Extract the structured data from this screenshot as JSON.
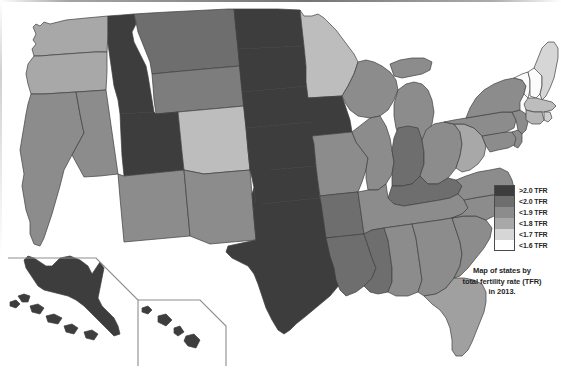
{
  "legend": {
    "title": "TFR legend",
    "entries": [
      {
        "label": ">2.0 TFR",
        "color": "#3d3d3d"
      },
      {
        "label": "<2.0 TFR",
        "color": "#6e6e6e"
      },
      {
        "label": "<1.9 TFR",
        "color": "#8c8c8c"
      },
      {
        "label": "<1.8 TFR",
        "color": "#a8a8a8"
      },
      {
        "label": "<1.7 TFR",
        "color": "#d6d6d6"
      },
      {
        "label": "<1.6 TFR",
        "color": "#ffffff"
      }
    ]
  },
  "caption": {
    "line1": "Map of states by",
    "line2": "total fertility rate (TFR)",
    "line3": "in 2013."
  },
  "map": {
    "title": "Map of states by total fertility rate (TFR) in 2013.",
    "stroke": "#3f3f3f",
    "states": [
      {
        "code": "WA",
        "name": "Washington",
        "bin": "<1.8 TFR",
        "color": "#a8a8a8"
      },
      {
        "code": "OR",
        "name": "Oregon",
        "bin": "<1.8 TFR",
        "color": "#a8a8a8"
      },
      {
        "code": "CA",
        "name": "California",
        "bin": "<1.9 TFR",
        "color": "#8c8c8c"
      },
      {
        "code": "NV",
        "name": "Nevada",
        "bin": "<1.9 TFR",
        "color": "#8c8c8c"
      },
      {
        "code": "ID",
        "name": "Idaho",
        "bin": ">2.0 TFR",
        "color": "#3d3d3d"
      },
      {
        "code": "MT",
        "name": "Montana",
        "bin": "<2.0 TFR",
        "color": "#6e6e6e"
      },
      {
        "code": "WY",
        "name": "Wyoming",
        "bin": "<2.0 TFR",
        "color": "#7d7d7d"
      },
      {
        "code": "UT",
        "name": "Utah",
        "bin": ">2.0 TFR",
        "color": "#3d3d3d"
      },
      {
        "code": "AZ",
        "name": "Arizona",
        "bin": "<1.9 TFR",
        "color": "#8c8c8c"
      },
      {
        "code": "CO",
        "name": "Colorado",
        "bin": "<1.8 TFR",
        "color": "#bdbdbd"
      },
      {
        "code": "NM",
        "name": "New Mexico",
        "bin": "<1.9 TFR",
        "color": "#8c8c8c"
      },
      {
        "code": "ND",
        "name": "North Dakota",
        "bin": ">2.0 TFR",
        "color": "#3d3d3d"
      },
      {
        "code": "SD",
        "name": "South Dakota",
        "bin": ">2.0 TFR",
        "color": "#3d3d3d"
      },
      {
        "code": "NE",
        "name": "Nebraska",
        "bin": ">2.0 TFR",
        "color": "#3d3d3d"
      },
      {
        "code": "KS",
        "name": "Kansas",
        "bin": ">2.0 TFR",
        "color": "#3d3d3d"
      },
      {
        "code": "OK",
        "name": "Oklahoma",
        "bin": ">2.0 TFR",
        "color": "#3d3d3d"
      },
      {
        "code": "TX",
        "name": "Texas",
        "bin": ">2.0 TFR",
        "color": "#3d3d3d"
      },
      {
        "code": "MN",
        "name": "Minnesota",
        "bin": "<1.8 TFR",
        "color": "#bdbdbd"
      },
      {
        "code": "IA",
        "name": "Iowa",
        "bin": ">2.0 TFR",
        "color": "#3d3d3d"
      },
      {
        "code": "MO",
        "name": "Missouri",
        "bin": "<2.0 TFR",
        "color": "#8c8c8c"
      },
      {
        "code": "AR",
        "name": "Arkansas",
        "bin": "<2.0 TFR",
        "color": "#6e6e6e"
      },
      {
        "code": "LA",
        "name": "Louisiana",
        "bin": "<2.0 TFR",
        "color": "#6e6e6e"
      },
      {
        "code": "WI",
        "name": "Wisconsin",
        "bin": "<1.9 TFR",
        "color": "#8c8c8c"
      },
      {
        "code": "IL",
        "name": "Illinois",
        "bin": "<1.9 TFR",
        "color": "#8c8c8c"
      },
      {
        "code": "MI",
        "name": "Michigan",
        "bin": "<1.9 TFR",
        "color": "#8c8c8c"
      },
      {
        "code": "IN",
        "name": "Indiana",
        "bin": "<2.0 TFR",
        "color": "#6e6e6e"
      },
      {
        "code": "OH",
        "name": "Ohio",
        "bin": "<1.9 TFR",
        "color": "#8c8c8c"
      },
      {
        "code": "KY",
        "name": "Kentucky",
        "bin": "<2.0 TFR",
        "color": "#6e6e6e"
      },
      {
        "code": "TN",
        "name": "Tennessee",
        "bin": "<1.9 TFR",
        "color": "#8c8c8c"
      },
      {
        "code": "MS",
        "name": "Mississippi",
        "bin": "<2.0 TFR",
        "color": "#6e6e6e"
      },
      {
        "code": "AL",
        "name": "Alabama",
        "bin": "<1.9 TFR",
        "color": "#8c8c8c"
      },
      {
        "code": "GA",
        "name": "Georgia",
        "bin": "<1.9 TFR",
        "color": "#8c8c8c"
      },
      {
        "code": "FL",
        "name": "Florida",
        "bin": "<1.8 TFR",
        "color": "#a0a0a0"
      },
      {
        "code": "SC",
        "name": "South Carolina",
        "bin": "<1.9 TFR",
        "color": "#8c8c8c"
      },
      {
        "code": "NC",
        "name": "North Carolina",
        "bin": "<1.9 TFR",
        "color": "#8c8c8c"
      },
      {
        "code": "VA",
        "name": "Virginia",
        "bin": "<1.9 TFR",
        "color": "#8c8c8c"
      },
      {
        "code": "WV",
        "name": "West Virginia",
        "bin": "<1.8 TFR",
        "color": "#a8a8a8"
      },
      {
        "code": "MD",
        "name": "Maryland",
        "bin": "<1.9 TFR",
        "color": "#8c8c8c"
      },
      {
        "code": "DE",
        "name": "Delaware",
        "bin": "<1.9 TFR",
        "color": "#8c8c8c"
      },
      {
        "code": "PA",
        "name": "Pennsylvania",
        "bin": "<1.9 TFR",
        "color": "#8c8c8c"
      },
      {
        "code": "NJ",
        "name": "New Jersey",
        "bin": "<1.9 TFR",
        "color": "#8c8c8c"
      },
      {
        "code": "NY",
        "name": "New York",
        "bin": "<1.9 TFR",
        "color": "#8c8c8c"
      },
      {
        "code": "CT",
        "name": "Connecticut",
        "bin": "<1.8 TFR",
        "color": "#b5b5b5"
      },
      {
        "code": "RI",
        "name": "Rhode Island",
        "bin": "<1.7 TFR",
        "color": "#cfcfcf"
      },
      {
        "code": "MA",
        "name": "Massachusetts",
        "bin": "<1.8 TFR",
        "color": "#bdbdbd"
      },
      {
        "code": "VT",
        "name": "Vermont",
        "bin": "<1.6 TFR",
        "color": "#fbfbfb"
      },
      {
        "code": "NH",
        "name": "New Hampshire",
        "bin": "<1.6 TFR",
        "color": "#fbfbfb"
      },
      {
        "code": "ME",
        "name": "Maine",
        "bin": "<1.7 TFR",
        "color": "#d6d6d6"
      },
      {
        "code": "AK",
        "name": "Alaska",
        "bin": ">2.0 TFR",
        "color": "#3d3d3d"
      },
      {
        "code": "HI",
        "name": "Hawaii",
        "bin": ">2.0 TFR",
        "color": "#3d3d3d"
      }
    ]
  }
}
